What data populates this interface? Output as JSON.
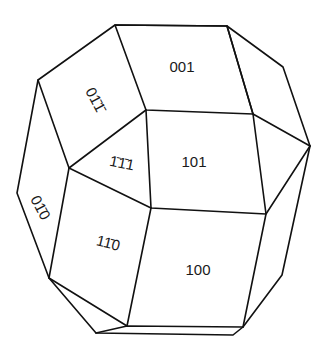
{
  "diagram": {
    "type": "crystal-habit",
    "stroke_color": "#111111",
    "background": "#ffffff",
    "faces": [
      {
        "id": "001",
        "label": "001",
        "x": 182,
        "y": 72,
        "rotate": 0
      },
      {
        "id": "101",
        "label": "101",
        "x": 194,
        "y": 167,
        "rotate": 0
      },
      {
        "id": "100",
        "label": "100",
        "x": 198,
        "y": 275,
        "rotate": 0
      },
      {
        "id": "-1-11",
        "label": "1̄1̄1",
        "x": 121,
        "y": 168,
        "rotate": 12
      },
      {
        "id": "1-10",
        "label": "11̄0",
        "x": 107,
        "y": 248,
        "rotate": 14
      },
      {
        "id": "0-1-1",
        "label": "01̄1̄",
        "x": 91,
        "y": 102,
        "rotate": 62
      },
      {
        "id": "0-10",
        "label": "01̄0",
        "x": 36,
        "y": 210,
        "rotate": 62
      }
    ]
  }
}
